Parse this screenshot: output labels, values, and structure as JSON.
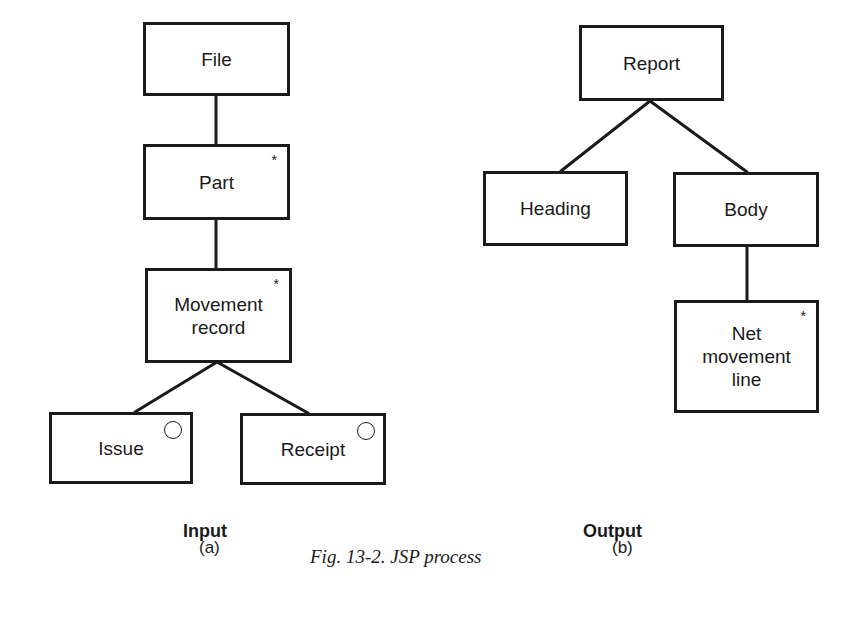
{
  "figure": {
    "caption": "Fig. 13-2. JSP process",
    "stroke_color": "#1a1a1a",
    "background_color": "#ffffff"
  },
  "input_diagram": {
    "title": "Input",
    "sublabel": "(a)",
    "nodes": {
      "file": {
        "label": "File",
        "marker": "none"
      },
      "part": {
        "label": "Part",
        "marker": "*"
      },
      "movement_record": {
        "label": "Movement\nrecord",
        "marker": "*"
      },
      "issue": {
        "label": "Issue",
        "marker": "o"
      },
      "receipt": {
        "label": "Receipt",
        "marker": "o"
      }
    },
    "edges": [
      [
        "file",
        "part"
      ],
      [
        "part",
        "movement_record"
      ],
      [
        "movement_record",
        "issue"
      ],
      [
        "movement_record",
        "receipt"
      ]
    ]
  },
  "output_diagram": {
    "title": "Output",
    "sublabel": "(b)",
    "nodes": {
      "report": {
        "label": "Report",
        "marker": "none"
      },
      "heading": {
        "label": "Heading",
        "marker": "none"
      },
      "body": {
        "label": "Body",
        "marker": "none"
      },
      "net_movement_line": {
        "label": "Net\nmovement\nline",
        "marker": "*"
      }
    },
    "edges": [
      [
        "report",
        "heading"
      ],
      [
        "report",
        "body"
      ],
      [
        "body",
        "net_movement_line"
      ]
    ]
  },
  "markers": {
    "iteration": "*",
    "selection": "o"
  }
}
